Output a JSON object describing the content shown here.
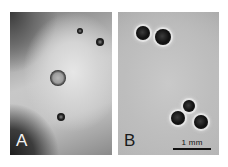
{
  "figure": {
    "panels": [
      {
        "id": "A",
        "label": "A",
        "particles": [
          {
            "type": "ring",
            "cx": 48,
            "cy": 66,
            "r": 8
          },
          {
            "type": "dot",
            "cx": 51,
            "cy": 105,
            "r": 4
          },
          {
            "type": "dot",
            "cx": 70,
            "cy": 19,
            "r": 3
          },
          {
            "type": "dot",
            "cx": 90,
            "cy": 30,
            "r": 4
          }
        ]
      },
      {
        "id": "B",
        "label": "B",
        "particles": [
          {
            "type": "dark",
            "cx": 25,
            "cy": 21,
            "r": 7
          },
          {
            "type": "dark",
            "cx": 45,
            "cy": 25,
            "r": 8
          },
          {
            "type": "dark",
            "cx": 71,
            "cy": 94,
            "r": 6
          },
          {
            "type": "dark",
            "cx": 60,
            "cy": 106,
            "r": 7
          },
          {
            "type": "dark",
            "cx": 83,
            "cy": 110,
            "r": 7
          }
        ],
        "scale_bar": {
          "label": "1 mm"
        }
      }
    ]
  }
}
